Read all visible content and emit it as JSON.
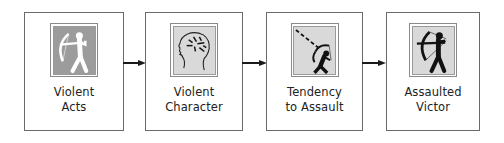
{
  "diagram": {
    "type": "flowchart",
    "direction": "left-to-right",
    "colors": {
      "border": "#6a6a6a",
      "arrow": "#1a1a1a",
      "icon_dark_bg": "#9c9c9c",
      "icon_light_bg": "#d9d9d9",
      "figure_white": "#ffffff",
      "figure_black": "#111111"
    },
    "nodes": [
      {
        "id": "violent-acts",
        "label_lines": [
          "Violent",
          "Acts"
        ],
        "icon": "archer-white-icon",
        "icon_style": "white archer on dark gray"
      },
      {
        "id": "violent-character",
        "label_lines": [
          "Violent",
          "Character"
        ],
        "icon": "head-profile-brain-icon",
        "icon_style": "outlined head profile with dashes inside, light gray"
      },
      {
        "id": "tendency-to-assault",
        "label_lines": [
          "Tendency",
          "to Assault"
        ],
        "icon": "archer-aiming-up-icon",
        "icon_style": "black archer aiming upward with dashed trajectory, light gray"
      },
      {
        "id": "assaulted-victor",
        "label_lines": [
          "Assaulted",
          "Victor"
        ],
        "icon": "archer-black-icon",
        "icon_style": "black archer on light gray"
      }
    ],
    "edges": [
      {
        "from": "violent-acts",
        "to": "violent-character"
      },
      {
        "from": "violent-character",
        "to": "tendency-to-assault"
      },
      {
        "from": "tendency-to-assault",
        "to": "assaulted-victor"
      }
    ]
  }
}
